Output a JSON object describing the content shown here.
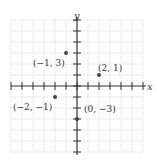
{
  "diagram": {
    "x_axis_label": "x",
    "y_axis_label": "y",
    "x_range": [
      -6,
      6
    ],
    "y_range": [
      -6,
      6
    ],
    "grid": true,
    "points": [
      {
        "x": -1,
        "y": 3,
        "label": "(−1, 3)"
      },
      {
        "x": 2,
        "y": 1,
        "label": "(2, 1)"
      },
      {
        "x": -2,
        "y": -1,
        "label": "(−2, −1)"
      },
      {
        "x": 0,
        "y": -3,
        "label": "(0, −3)"
      }
    ],
    "colors": {
      "grid": "#c8c8c8",
      "axis": "#333333",
      "point": "#444444"
    }
  }
}
